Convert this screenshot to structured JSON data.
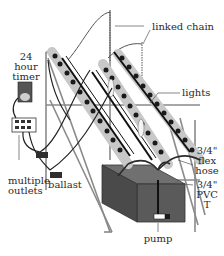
{
  "diagram": {
    "type": "hydroponic grow system illustration",
    "labels": {
      "timer_line1": "24",
      "timer_line2": "hour",
      "timer_line3": "timer",
      "outlets_line1": "multiple",
      "outlets_line2": "outlets",
      "ballast": "ballast",
      "linked_chain": "linked chain",
      "lights": "lights",
      "flex_line1": "3/4\"",
      "flex_line2": "flex",
      "flex_line3": "hose",
      "pvc_line1": "3/4\"",
      "pvc_line2": "PVC",
      "pvc_line3": "T",
      "pump": "pump"
    },
    "colors": {
      "line": "#333333",
      "tube_fill": "#c8c8c8",
      "tube_dot": "#1a1a1a",
      "reservoir_top": "#707070",
      "reservoir_front": "#5a5a5a",
      "reservoir_side": "#4a4a4a",
      "timer_body": "#555555",
      "timer_dial": "#cfcfcf",
      "ballast": "#2e2e2e",
      "frame": "#8a8a8a"
    }
  }
}
